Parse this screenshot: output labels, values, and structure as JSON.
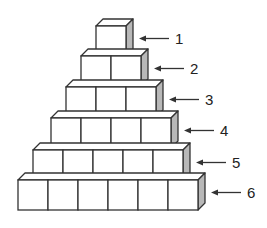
{
  "diagram": {
    "colors": {
      "stroke": "#333333",
      "front": "#ffffff",
      "side": "#b8b8b8",
      "top": "#ffffff"
    },
    "rows": [
      {
        "label": "1",
        "cubes": 1
      },
      {
        "label": "2",
        "cubes": 2
      },
      {
        "label": "3",
        "cubes": 3
      },
      {
        "label": "4",
        "cubes": 4
      },
      {
        "label": "5",
        "cubes": 5
      },
      {
        "label": "6",
        "cubes": 6
      }
    ]
  }
}
